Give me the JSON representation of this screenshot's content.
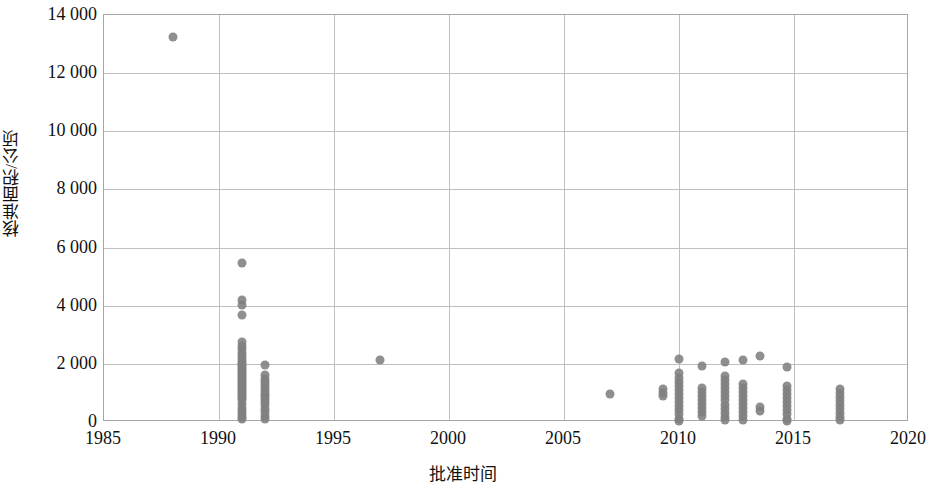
{
  "chart_data": {
    "type": "scatter",
    "title": "",
    "xlabel": "批准时间",
    "ylabel": "核准面积/公顷",
    "xlim": [
      1985,
      2020
    ],
    "ylim": [
      0,
      14000
    ],
    "x_ticks": [
      "1985",
      "1990",
      "1995",
      "2000",
      "2005",
      "2010",
      "2015",
      "2020"
    ],
    "x_tick_values": [
      1985,
      1990,
      1995,
      2000,
      2005,
      2010,
      2015,
      2020
    ],
    "y_ticks": [
      "0",
      "2 000",
      "4 000",
      "6 000",
      "8 000",
      "10 000",
      "12 000",
      "14 000"
    ],
    "y_tick_values": [
      0,
      2000,
      4000,
      6000,
      8000,
      10000,
      12000,
      14000
    ],
    "grid": "horizontal-and-vertical",
    "legend": "none",
    "marker_color": "#7f7f7f",
    "marker_size": 9,
    "series": [
      {
        "name": "批准面积",
        "points": [
          [
            1988.0,
            13250
          ],
          [
            1991.0,
            5480
          ],
          [
            1991.0,
            4180
          ],
          [
            1991.0,
            4020
          ],
          [
            1991.0,
            3680
          ],
          [
            1991.0,
            2760
          ],
          [
            1991.0,
            2620
          ],
          [
            1991.0,
            2500
          ],
          [
            1991.0,
            2380
          ],
          [
            1991.0,
            2260
          ],
          [
            1991.0,
            2160
          ],
          [
            1991.0,
            2080
          ],
          [
            1991.0,
            2000
          ],
          [
            1991.0,
            1930
          ],
          [
            1991.0,
            1860
          ],
          [
            1991.0,
            1790
          ],
          [
            1991.0,
            1720
          ],
          [
            1991.0,
            1650
          ],
          [
            1991.0,
            1580
          ],
          [
            1991.0,
            1510
          ],
          [
            1991.0,
            1440
          ],
          [
            1991.0,
            1370
          ],
          [
            1991.0,
            1300
          ],
          [
            1991.0,
            1230
          ],
          [
            1991.0,
            1160
          ],
          [
            1991.0,
            1090
          ],
          [
            1991.0,
            1020
          ],
          [
            1991.0,
            950
          ],
          [
            1991.0,
            880
          ],
          [
            1991.0,
            810
          ],
          [
            1991.0,
            740
          ],
          [
            1991.0,
            620
          ],
          [
            1991.0,
            470
          ],
          [
            1991.0,
            380
          ],
          [
            1991.0,
            280
          ],
          [
            1991.0,
            180
          ],
          [
            1991.0,
            90
          ],
          [
            1992.0,
            1960
          ],
          [
            1992.0,
            1600
          ],
          [
            1992.0,
            1480
          ],
          [
            1992.0,
            1380
          ],
          [
            1992.0,
            1280
          ],
          [
            1992.0,
            1180
          ],
          [
            1992.0,
            1080
          ],
          [
            1992.0,
            980
          ],
          [
            1992.0,
            880
          ],
          [
            1992.0,
            780
          ],
          [
            1992.0,
            680
          ],
          [
            1992.0,
            580
          ],
          [
            1992.0,
            460
          ],
          [
            1992.0,
            330
          ],
          [
            1992.0,
            200
          ],
          [
            1992.0,
            100
          ],
          [
            1997.0,
            2120
          ],
          [
            2007.0,
            950
          ],
          [
            2009.3,
            1140
          ],
          [
            2009.3,
            1000
          ],
          [
            2009.3,
            880
          ],
          [
            2010.0,
            2180
          ],
          [
            2010.0,
            1680
          ],
          [
            2010.0,
            1520
          ],
          [
            2010.0,
            1380
          ],
          [
            2010.0,
            1240
          ],
          [
            2010.0,
            1100
          ],
          [
            2010.0,
            960
          ],
          [
            2010.0,
            820
          ],
          [
            2010.0,
            680
          ],
          [
            2010.0,
            540
          ],
          [
            2010.0,
            400
          ],
          [
            2010.0,
            260
          ],
          [
            2010.0,
            120
          ],
          [
            2010.0,
            40
          ],
          [
            2011.0,
            1940
          ],
          [
            2011.0,
            1180
          ],
          [
            2011.0,
            1040
          ],
          [
            2011.0,
            900
          ],
          [
            2011.0,
            760
          ],
          [
            2011.0,
            620
          ],
          [
            2011.0,
            480
          ],
          [
            2011.0,
            340
          ],
          [
            2011.0,
            200
          ],
          [
            2012.0,
            2080
          ],
          [
            2012.0,
            1580
          ],
          [
            2012.0,
            1440
          ],
          [
            2012.0,
            1300
          ],
          [
            2012.0,
            1160
          ],
          [
            2012.0,
            1020
          ],
          [
            2012.0,
            880
          ],
          [
            2012.0,
            740
          ],
          [
            2012.0,
            600
          ],
          [
            2012.0,
            460
          ],
          [
            2012.0,
            320
          ],
          [
            2012.0,
            180
          ],
          [
            2012.0,
            60
          ],
          [
            2012.8,
            2120
          ],
          [
            2012.8,
            1320
          ],
          [
            2012.8,
            1180
          ],
          [
            2012.8,
            1040
          ],
          [
            2012.8,
            900
          ],
          [
            2012.8,
            760
          ],
          [
            2012.8,
            620
          ],
          [
            2012.8,
            480
          ],
          [
            2012.8,
            340
          ],
          [
            2012.8,
            200
          ],
          [
            2012.8,
            80
          ],
          [
            2013.5,
            2260
          ],
          [
            2013.5,
            500
          ],
          [
            2013.5,
            380
          ],
          [
            2014.7,
            1880
          ],
          [
            2014.7,
            1240
          ],
          [
            2014.7,
            1100
          ],
          [
            2014.7,
            960
          ],
          [
            2014.7,
            820
          ],
          [
            2014.7,
            680
          ],
          [
            2014.7,
            540
          ],
          [
            2014.7,
            400
          ],
          [
            2014.7,
            260
          ],
          [
            2014.7,
            120
          ],
          [
            2014.7,
            40
          ],
          [
            2017.0,
            1140
          ],
          [
            2017.0,
            1000
          ],
          [
            2017.0,
            860
          ],
          [
            2017.0,
            720
          ],
          [
            2017.0,
            580
          ],
          [
            2017.0,
            440
          ],
          [
            2017.0,
            300
          ],
          [
            2017.0,
            160
          ],
          [
            2017.0,
            60
          ]
        ]
      }
    ]
  }
}
